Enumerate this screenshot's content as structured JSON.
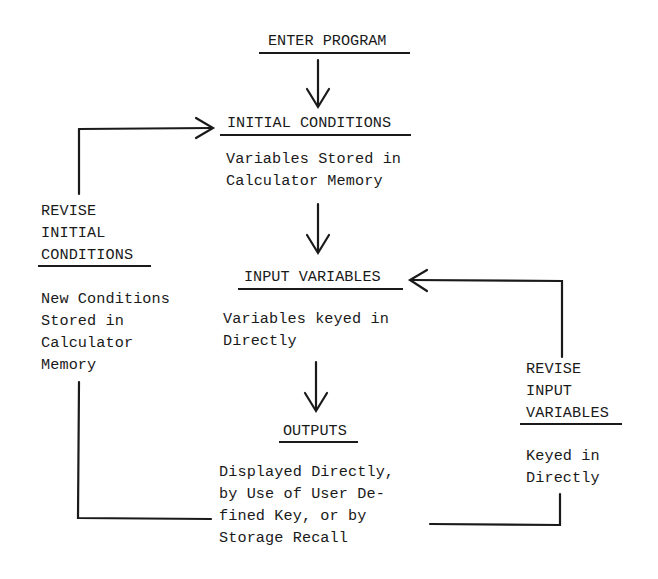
{
  "diagram": {
    "nodes": {
      "enter_program": {
        "title": "ENTER PROGRAM"
      },
      "initial_conditions": {
        "title": "INITIAL CONDITIONS",
        "description": [
          "Variables Stored in",
          "Calculator Memory"
        ]
      },
      "input_variables": {
        "title": "INPUT VARIABLES",
        "description": [
          "Variables keyed in",
          "Directly"
        ]
      },
      "outputs": {
        "title": "OUTPUTS",
        "description": [
          "Displayed Directly,",
          "by Use of User De-",
          "fined Key, or by",
          "Storage Recall"
        ]
      },
      "revise_initial_conditions": {
        "title": [
          "REVISE",
          "INITIAL",
          "CONDITIONS"
        ],
        "description": [
          "New Conditions",
          "Stored in",
          "Calculator",
          "Memory"
        ]
      },
      "revise_input_variables": {
        "title": [
          "REVISE",
          "INPUT",
          "VARIABLES"
        ],
        "description": [
          "Keyed in",
          "Directly"
        ]
      }
    },
    "edges": [
      {
        "from": "ENTER PROGRAM",
        "to": "INITIAL CONDITIONS"
      },
      {
        "from": "INITIAL CONDITIONS",
        "to": "INPUT VARIABLES"
      },
      {
        "from": "INPUT VARIABLES",
        "to": "OUTPUTS"
      },
      {
        "from": "OUTPUTS",
        "to": "REVISE INITIAL CONDITIONS"
      },
      {
        "from": "REVISE INITIAL CONDITIONS",
        "to": "INITIAL CONDITIONS"
      },
      {
        "from": "OUTPUTS",
        "to": "REVISE INPUT VARIABLES"
      },
      {
        "from": "REVISE INPUT VARIABLES",
        "to": "INPUT VARIABLES"
      }
    ],
    "colors": {
      "ink": "#1a1a1a",
      "background": "#ffffff"
    }
  }
}
